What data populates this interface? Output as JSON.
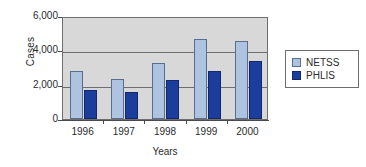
{
  "chart_data": {
    "type": "bar",
    "title": "",
    "xlabel": "Years",
    "ylabel": "Cases",
    "categories": [
      "1996",
      "1997",
      "1998",
      "1999",
      "2000"
    ],
    "series": [
      {
        "name": "NETSS",
        "color": "#aec3e0",
        "values": [
          2800,
          2350,
          3250,
          4650,
          4550
        ]
      },
      {
        "name": "PHLIS",
        "color": "#1b3d9c",
        "values": [
          1700,
          1550,
          2250,
          2800,
          3400
        ]
      }
    ],
    "ylim": [
      0,
      6000
    ],
    "ytick_labels": [
      "6,000",
      "4,000",
      "2,000",
      "0"
    ],
    "ytick_values": [
      6000,
      4000,
      2000,
      0
    ],
    "grid": true,
    "legend_position": "right",
    "plot_background": "#d8d8d8"
  },
  "axes": {
    "y_title": "Cases",
    "x_title": "Years",
    "y_ticks": [
      {
        "label": "6,000",
        "value": 6000
      },
      {
        "label": "4,000",
        "value": 4000
      },
      {
        "label": "2,000",
        "value": 2000
      },
      {
        "label": "0",
        "value": 0
      }
    ],
    "x_ticks": [
      {
        "label": "1996"
      },
      {
        "label": "1997"
      },
      {
        "label": "1998"
      },
      {
        "label": "1999"
      },
      {
        "label": "2000"
      }
    ]
  },
  "legend": {
    "items": [
      {
        "label": "NETSS",
        "color": "#aec3e0"
      },
      {
        "label": "PHLIS",
        "color": "#1b3d9c"
      }
    ]
  }
}
